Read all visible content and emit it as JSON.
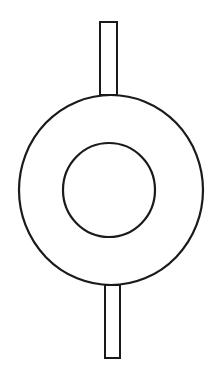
{
  "diagram": {
    "stroke_color": "#1a1a1a",
    "background_color": "#ffffff",
    "shapes": {
      "top_bar": {
        "x": 100,
        "y": 22,
        "width": 17,
        "height": 73
      },
      "bottom_bar": {
        "x": 105,
        "y": 285,
        "width": 15,
        "height": 73
      },
      "outer_circle": {
        "cx": 111,
        "cy": 190,
        "rx": 92,
        "ry": 95
      },
      "inner_circle": {
        "cx": 109,
        "cy": 190,
        "rx": 46,
        "ry": 47
      }
    }
  }
}
